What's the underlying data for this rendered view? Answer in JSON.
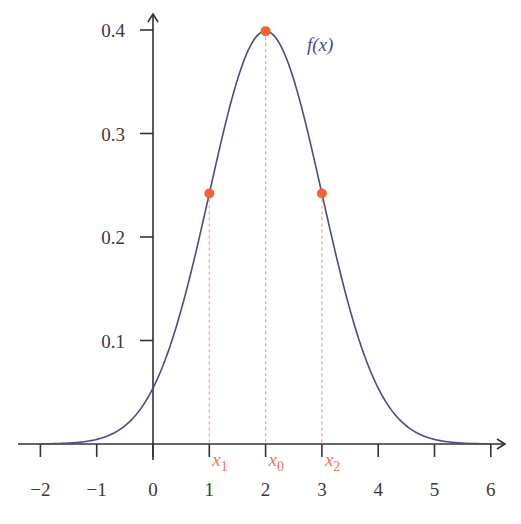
{
  "chart_data": {
    "type": "line",
    "title": "",
    "xlabel": "",
    "ylabel": "",
    "xlim": [
      -2.2,
      6.4
    ],
    "ylim": [
      0,
      0.42
    ],
    "grid": false,
    "x_ticks": [
      -2,
      -1,
      0,
      1,
      2,
      3,
      4,
      5,
      6
    ],
    "x_tick_labels": [
      "−2",
      "−1",
      "0",
      "1",
      "2",
      "3",
      "4",
      "5",
      "6"
    ],
    "y_ticks": [
      0.1,
      0.2,
      0.3,
      0.4
    ],
    "y_tick_labels": [
      "0.1",
      "0.2",
      "0.3",
      "0.4"
    ],
    "series": [
      {
        "name": "f(x)",
        "label": "f(x)",
        "distribution": "normal",
        "mean": 2,
        "std": 1,
        "x": [
          -2,
          -1.5,
          -1,
          -0.5,
          0,
          0.5,
          1,
          1.5,
          2,
          2.5,
          3,
          3.5,
          4,
          4.5,
          5,
          5.5,
          6
        ],
        "values": [
          0.0001,
          0.0009,
          0.0044,
          0.0175,
          0.054,
          0.1295,
          0.242,
          0.3521,
          0.3989,
          0.3521,
          0.242,
          0.1295,
          0.054,
          0.0175,
          0.0044,
          0.0009,
          0.0001
        ],
        "color": "#4a4a8c"
      }
    ],
    "points": [
      {
        "name": "x1",
        "x": 1,
        "y": 0.242,
        "label": "x",
        "subscript": "1"
      },
      {
        "name": "x0",
        "x": 2,
        "y": 0.3989,
        "label": "x",
        "subscript": "0"
      },
      {
        "name": "x2",
        "x": 3,
        "y": 0.242,
        "label": "x",
        "subscript": "2"
      }
    ],
    "annotations": [
      {
        "text": "f(x)",
        "x": 2.85,
        "y": 0.385
      }
    ],
    "colors": {
      "curve": "#4a4a8c",
      "points": "#f26430",
      "dashed": "#f4a28a",
      "point_labels": "#f0735a",
      "axis": "#333333"
    }
  }
}
